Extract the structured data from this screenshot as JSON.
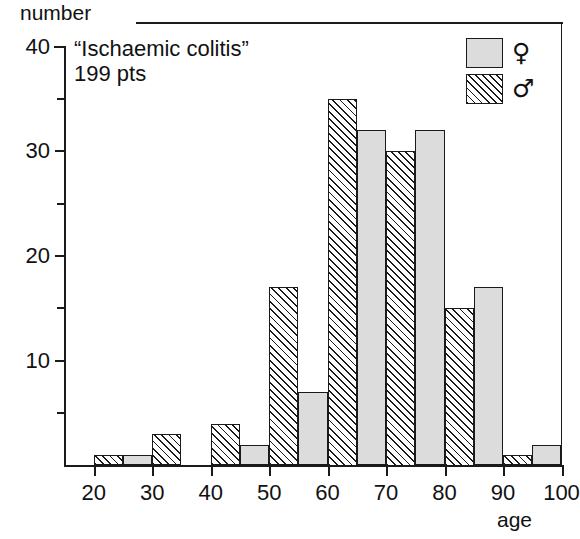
{
  "chart_data": {
    "type": "bar",
    "title": "“Ischaemic colitis”",
    "subtitle": "199 pts",
    "xlabel": "age",
    "ylabel": "number",
    "grid": false,
    "legend_position": "top-right",
    "bin_width": 5,
    "xlim": [
      15,
      100
    ],
    "ylim": [
      0,
      40
    ],
    "xticks": [
      20,
      30,
      40,
      50,
      60,
      70,
      80,
      90,
      100
    ],
    "xtick_labels": [
      "20",
      "30",
      "40",
      "50",
      "60",
      "70",
      "80",
      "90",
      "100"
    ],
    "yticks": [
      10,
      20,
      30,
      40
    ],
    "ytick_labels": [
      "10",
      "20",
      "30",
      "40"
    ],
    "yticks_minor": [
      5,
      15,
      25,
      35
    ],
    "bins": [
      {
        "range": "20-25",
        "start": 20,
        "end": 25,
        "series": "male",
        "value": 1
      },
      {
        "range": "25-30",
        "start": 25,
        "end": 30,
        "series": "female",
        "value": 1
      },
      {
        "range": "30-35",
        "start": 30,
        "end": 35,
        "series": "male",
        "value": 3
      },
      {
        "range": "35-40",
        "start": 35,
        "end": 40,
        "series": "female",
        "value": 0
      },
      {
        "range": "40-45",
        "start": 40,
        "end": 45,
        "series": "male",
        "value": 4
      },
      {
        "range": "45-50",
        "start": 45,
        "end": 50,
        "series": "female",
        "value": 2
      },
      {
        "range": "50-55",
        "start": 50,
        "end": 55,
        "series": "male",
        "value": 17
      },
      {
        "range": "55-60",
        "start": 55,
        "end": 60,
        "series": "female",
        "value": 7
      },
      {
        "range": "60-65",
        "start": 60,
        "end": 65,
        "series": "male",
        "value": 35
      },
      {
        "range": "65-70",
        "start": 65,
        "end": 70,
        "series": "female",
        "value": 32
      },
      {
        "range": "70-75",
        "start": 70,
        "end": 75,
        "series": "male",
        "value": 30
      },
      {
        "range": "75-80",
        "start": 75,
        "end": 80,
        "series": "female",
        "value": 32
      },
      {
        "range": "80-85",
        "start": 80,
        "end": 85,
        "series": "male",
        "value": 15
      },
      {
        "range": "85-90",
        "start": 85,
        "end": 90,
        "series": "female",
        "value": 17
      },
      {
        "range": "90-95",
        "start": 90,
        "end": 95,
        "series": "male",
        "value": 1
      },
      {
        "range": "95-100",
        "start": 95,
        "end": 100,
        "series": "female",
        "value": 2
      }
    ],
    "series": [
      {
        "name": "female",
        "symbol": "♀",
        "fill": "solid-light-gray",
        "color": "#dcdcdc",
        "categories": [
          "25-30",
          "35-40",
          "45-50",
          "55-60",
          "65-70",
          "75-80",
          "85-90",
          "95-100"
        ],
        "values": [
          1,
          0,
          2,
          7,
          32,
          32,
          17,
          2
        ]
      },
      {
        "name": "male",
        "symbol": "♂",
        "fill": "diagonal-hatch",
        "color": "#1a1a1a",
        "categories": [
          "20-25",
          "30-35",
          "40-45",
          "50-55",
          "60-65",
          "70-75",
          "80-85",
          "90-95"
        ],
        "values": [
          1,
          3,
          4,
          17,
          35,
          30,
          15,
          1
        ]
      }
    ]
  },
  "legend": {
    "rows": [
      {
        "series": "female",
        "symbol": "♀"
      },
      {
        "series": "male",
        "symbol": "♂"
      }
    ]
  }
}
